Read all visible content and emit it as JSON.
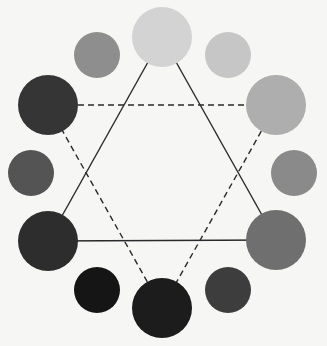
{
  "canvas": {
    "width": 327,
    "height": 346,
    "background": "#f6f6f5"
  },
  "diagram": {
    "title": "",
    "circles": [
      {
        "id": "top",
        "cx": 162,
        "cy": 37,
        "r": 30,
        "fill": "#d3d3d3",
        "size": "large"
      },
      {
        "id": "upper-right",
        "cx": 228,
        "cy": 55,
        "r": 23,
        "fill": "#c6c6c6",
        "size": "small"
      },
      {
        "id": "right-upper",
        "cx": 276,
        "cy": 105,
        "r": 30,
        "fill": "#aeaeae",
        "size": "large"
      },
      {
        "id": "right-middle",
        "cx": 294,
        "cy": 173,
        "r": 23,
        "fill": "#8a8a8a",
        "size": "small"
      },
      {
        "id": "right-lower",
        "cx": 276,
        "cy": 240,
        "r": 30,
        "fill": "#6f6f6f",
        "size": "large"
      },
      {
        "id": "lower-right",
        "cx": 228,
        "cy": 290,
        "r": 23,
        "fill": "#3d3d3d",
        "size": "small"
      },
      {
        "id": "bottom",
        "cx": 162,
        "cy": 308,
        "r": 30,
        "fill": "#1c1c1c",
        "size": "large"
      },
      {
        "id": "lower-left",
        "cx": 97,
        "cy": 290,
        "r": 23,
        "fill": "#151515",
        "size": "small"
      },
      {
        "id": "left-lower",
        "cx": 48,
        "cy": 241,
        "r": 30,
        "fill": "#2d2d2d",
        "size": "large"
      },
      {
        "id": "left-middle",
        "cx": 31,
        "cy": 173,
        "r": 23,
        "fill": "#545454",
        "size": "small"
      },
      {
        "id": "left-upper",
        "cx": 48,
        "cy": 105,
        "r": 30,
        "fill": "#353535",
        "size": "large"
      },
      {
        "id": "upper-left",
        "cx": 97,
        "cy": 55,
        "r": 23,
        "fill": "#8e8e8e",
        "size": "small"
      }
    ],
    "solid_triangle": {
      "stroke": "#2a2a2a",
      "stroke_width": 1.4,
      "vertices": [
        "top",
        "right-lower",
        "left-lower"
      ]
    },
    "dashed_triangle": {
      "stroke": "#2a2a2a",
      "stroke_width": 1.4,
      "dash": "6 4",
      "vertices": [
        "left-upper",
        "right-upper",
        "bottom"
      ]
    }
  }
}
